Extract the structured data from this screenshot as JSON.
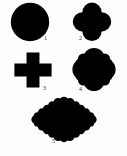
{
  "figure": {
    "background_color": "#fdfdfd",
    "ink_color": "#000000",
    "label_color": "#2b2b2b",
    "width": 127,
    "height": 156,
    "shapes": [
      {
        "number": "1",
        "name": "circle",
        "description": "Solid black filled circle",
        "lobes": 0,
        "iteration": 0
      },
      {
        "number": "2",
        "name": "quatrefoil",
        "description": "Solid black four-lobed clover shape",
        "lobes": 4,
        "iteration": 1
      },
      {
        "number": "3",
        "name": "greek-cross",
        "description": "Solid black plus-sign cross with equal arms",
        "lobes": 4,
        "iteration": 1
      },
      {
        "number": "4",
        "name": "ornate-quatrefoil",
        "description": "Solid black quatrefoil with small secondary lobes at the corners",
        "lobes": 12,
        "iteration": 2
      },
      {
        "number": "5",
        "name": "scalloped-diamond",
        "description": "Solid black diamond with many small scalloped bumps along every edge",
        "lobes": 32,
        "iteration": 3
      }
    ]
  }
}
